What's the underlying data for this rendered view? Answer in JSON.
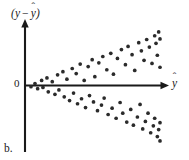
{
  "figure": {
    "panel_caption": "b.",
    "origin_label": "0",
    "y_axis_label": "(y − ŷ)",
    "x_axis_label": "ŷ",
    "point_color": "#2b2b2b",
    "axis_color": "#1a1a1a",
    "background_color": "#ffffff"
  },
  "chart_data": {
    "type": "scatter",
    "title": "",
    "subtitle": "",
    "xlabel": "ŷ",
    "ylabel": "(y − ŷ)",
    "annotations": [
      "b.",
      "0"
    ],
    "grid": false,
    "legend": null,
    "pattern": "fan / megaphone — residual variance increases with fitted value (heteroscedasticity)",
    "xlim": [
      0,
      100
    ],
    "ylim": [
      -100,
      100
    ],
    "x_tick_labels": [],
    "y_tick_labels": [
      "0"
    ],
    "reference_line": {
      "orientation": "horizontal",
      "y": 0
    },
    "n_points": 74,
    "points": [
      [
        3,
        -2
      ],
      [
        6,
        3
      ],
      [
        8,
        -5
      ],
      [
        11,
        8
      ],
      [
        12,
        -3
      ],
      [
        15,
        12
      ],
      [
        16,
        -10
      ],
      [
        19,
        6
      ],
      [
        21,
        -14
      ],
      [
        23,
        17
      ],
      [
        24,
        -7
      ],
      [
        27,
        22
      ],
      [
        28,
        -18
      ],
      [
        30,
        10
      ],
      [
        32,
        -24
      ],
      [
        34,
        27
      ],
      [
        35,
        -12
      ],
      [
        37,
        19
      ],
      [
        38,
        -29
      ],
      [
        40,
        34
      ],
      [
        41,
        -21
      ],
      [
        43,
        8
      ],
      [
        44,
        -35
      ],
      [
        46,
        30
      ],
      [
        47,
        -16
      ],
      [
        49,
        41
      ],
      [
        50,
        -26
      ],
      [
        51,
        14
      ],
      [
        53,
        -40
      ],
      [
        54,
        36
      ],
      [
        56,
        -31
      ],
      [
        57,
        46
      ],
      [
        58,
        -20
      ],
      [
        60,
        25
      ],
      [
        61,
        -46
      ],
      [
        63,
        51
      ],
      [
        64,
        -36
      ],
      [
        65,
        18
      ],
      [
        67,
        -52
      ],
      [
        68,
        43
      ],
      [
        70,
        -27
      ],
      [
        71,
        57
      ],
      [
        72,
        -44
      ],
      [
        74,
        33
      ],
      [
        75,
        -58
      ],
      [
        76,
        62
      ],
      [
        78,
        -38
      ],
      [
        79,
        49
      ],
      [
        80,
        -63
      ],
      [
        81,
        24
      ],
      [
        83,
        -50
      ],
      [
        84,
        68
      ],
      [
        85,
        -30
      ],
      [
        86,
        55
      ],
      [
        87,
        -69
      ],
      [
        88,
        40
      ],
      [
        89,
        -57
      ],
      [
        90,
        73
      ],
      [
        91,
        -44
      ],
      [
        92,
        61
      ],
      [
        93,
        -75
      ],
      [
        94,
        35
      ],
      [
        95,
        -64
      ],
      [
        96,
        79
      ],
      [
        96,
        -52
      ],
      [
        97,
        67
      ],
      [
        98,
        -81
      ],
      [
        98,
        48
      ],
      [
        99,
        -70
      ],
      [
        99,
        85
      ],
      [
        100,
        -59
      ],
      [
        100,
        74
      ],
      [
        100,
        -88
      ],
      [
        100,
        29
      ]
    ]
  }
}
